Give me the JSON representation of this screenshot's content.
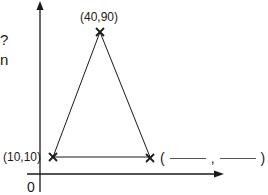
{
  "cropped_text": {
    "line1_fragment": "?",
    "line2_fragment": "n"
  },
  "axes": {
    "origin_label": "0",
    "x_axis_direction": "right",
    "y_axis_direction": "up"
  },
  "triangle": {
    "vertices": [
      {
        "name": "top",
        "label": "(40,90)",
        "x": 40,
        "y": 90
      },
      {
        "name": "bottom-left",
        "label": "(10,10)",
        "x": 10,
        "y": 10
      },
      {
        "name": "bottom-right",
        "label_open": "(",
        "label_sep": ",",
        "label_close": ")",
        "x": null,
        "y": null
      }
    ],
    "marker": "×"
  },
  "colors": {
    "stroke": "#1a1a1a",
    "background": "#ffffff"
  }
}
